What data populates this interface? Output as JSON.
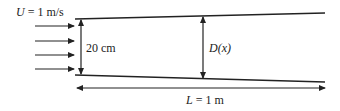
{
  "diagram": {
    "inlet_velocity_label": "U = 1 m/s",
    "inlet_velocity_symbol": "U",
    "inlet_velocity_value": " = 1 m/s",
    "inlet_height_label": "20 cm",
    "diameter_label": "D(x)",
    "diameter_symbol": "D",
    "diameter_arg": "(x)",
    "length_label": "L = 1 m",
    "length_symbol": "L",
    "length_value": " = 1 m",
    "line_color": "#222222",
    "inflow_arrow_count": 4
  }
}
